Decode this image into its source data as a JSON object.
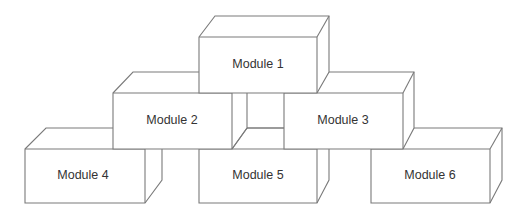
{
  "diagram": {
    "type": "stacked-module-blocks",
    "layout": "pyramid",
    "colors": {
      "stroke": "#7a7a7a",
      "fill": "#ffffff",
      "text": "#333333"
    },
    "modules": [
      {
        "id": 1,
        "label": "Module 1",
        "row": 1
      },
      {
        "id": 2,
        "label": "Module 2",
        "row": 2
      },
      {
        "id": 3,
        "label": "Module 3",
        "row": 2
      },
      {
        "id": 4,
        "label": "Module 4",
        "row": 3
      },
      {
        "id": 5,
        "label": "Module 5",
        "row": 3
      },
      {
        "id": 6,
        "label": "Module 6",
        "row": 3
      }
    ]
  }
}
